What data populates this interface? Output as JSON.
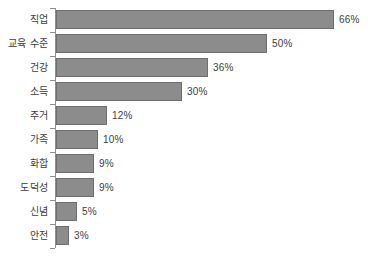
{
  "chart_data": {
    "type": "bar",
    "orientation": "horizontal",
    "title": "",
    "subtitle": "",
    "xlabel": "",
    "ylabel": "",
    "grid": false,
    "legend": null,
    "legend_position": "none",
    "xlim": [
      0,
      66
    ],
    "axis_visible": "category-axis-only",
    "value_suffix": "%",
    "categories": [
      "직업",
      "교육 수준",
      "건강",
      "소득",
      "주거",
      "가족",
      "화합",
      "도덕성",
      "신념",
      "안전"
    ],
    "values": [
      66,
      50,
      36,
      30,
      12,
      10,
      9,
      9,
      5,
      3
    ],
    "data_labels": [
      "66%",
      "50%",
      "36%",
      "30%",
      "12%",
      "10%",
      "9%",
      "9%",
      "5%",
      "3%"
    ],
    "bars": [
      {
        "label": "직업",
        "value": 66,
        "data_label": "66%"
      },
      {
        "label": "교육 수준",
        "value": 50,
        "data_label": "50%"
      },
      {
        "label": "건강",
        "value": 36,
        "data_label": "36%"
      },
      {
        "label": "소득",
        "value": 30,
        "data_label": "30%"
      },
      {
        "label": "주거",
        "value": 12,
        "data_label": "12%"
      },
      {
        "label": "가족",
        "value": 10,
        "data_label": "10%"
      },
      {
        "label": "화합",
        "value": 9,
        "data_label": "9%"
      },
      {
        "label": "도덕성",
        "value": 9,
        "data_label": "9%"
      },
      {
        "label": "신념",
        "value": 5,
        "data_label": "5%"
      },
      {
        "label": "안전",
        "value": 3,
        "data_label": "3%"
      }
    ],
    "colors": {
      "bar_fill": "#8c8c8c",
      "bar_border": "#6e6e6e",
      "axis": "#8f8f8f",
      "text": "#3d3d3d",
      "background": "#ffffff"
    }
  }
}
